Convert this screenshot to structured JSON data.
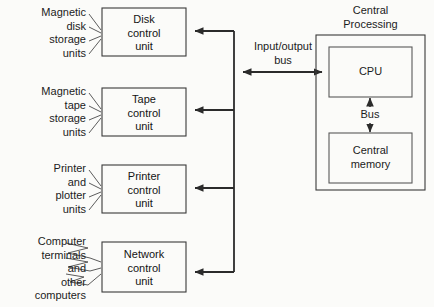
{
  "diagram": {
    "background_color": "#fbfbf9",
    "line_color": "#2b2b2b",
    "text_color": "#1c1c1c",
    "peripheral_groups": [
      {
        "id": "magnetic-disk",
        "lines": [
          "Magnetic",
          "disk",
          "storage",
          "units"
        ],
        "connector": "straight"
      },
      {
        "id": "magnetic-tape",
        "lines": [
          "Magnetic",
          "tape",
          "storage",
          "units"
        ],
        "connector": "straight"
      },
      {
        "id": "printer-plotter",
        "lines": [
          "Printer",
          "and",
          "plotter",
          "units"
        ],
        "connector": "straight"
      },
      {
        "id": "computer-terminals",
        "lines": [
          "Computer",
          "terminals",
          "and",
          "other",
          "computers"
        ],
        "connector": "zigzag"
      }
    ],
    "control_units": [
      {
        "id": "disk-control-unit",
        "lines": [
          "Disk",
          "control",
          "unit"
        ]
      },
      {
        "id": "tape-control-unit",
        "lines": [
          "Tape",
          "control",
          "unit"
        ]
      },
      {
        "id": "printer-control-unit",
        "lines": [
          "Printer",
          "control",
          "unit"
        ]
      },
      {
        "id": "network-control-unit",
        "lines": [
          "Network",
          "control",
          "unit"
        ]
      }
    ],
    "bus": {
      "io_bus_label_line1": "Input/output",
      "io_bus_label_line2": "bus",
      "internal_bus_label": "Bus"
    },
    "central_processing": {
      "title_line1": "Central",
      "title_line2": "Processing",
      "cpu_label": "CPU",
      "memory_label_line1": "Central",
      "memory_label_line2": "memory"
    }
  }
}
